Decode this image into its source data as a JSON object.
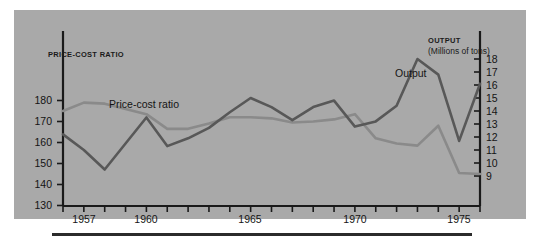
{
  "figure": {
    "panel_background": "#a9a9a9",
    "ink_color": "#1a1a1a"
  },
  "axes": {
    "left_title": "PRICE-COST RATIO",
    "right_title_line1": "OUTPUT",
    "right_title_line2": "(Millions of tons)",
    "left_ticks": [
      "180",
      "170",
      "160",
      "150",
      "140",
      "130"
    ],
    "right_ticks": [
      "18",
      "17",
      "16",
      "15",
      "14",
      "13",
      "12",
      "11",
      "10",
      "9"
    ],
    "x_ticks": [
      "1957",
      "1960",
      "1965",
      "1970",
      "1975"
    ]
  },
  "series_labels": {
    "price_cost": "Price-cost ratio",
    "output": "Output"
  },
  "chart_data": {
    "type": "line",
    "title": "",
    "subtitle": "",
    "xlabel": "",
    "ylabel": "PRICE-COST RATIO",
    "y2label": "OUTPUT (Millions of tons)",
    "grid": false,
    "legend_position": "inline-annotations",
    "x": [
      1956,
      1957,
      1958,
      1959,
      1960,
      1961,
      1962,
      1963,
      1964,
      1965,
      1966,
      1967,
      1968,
      1969,
      1970,
      1971,
      1972,
      1973,
      1974,
      1975,
      1976
    ],
    "xlim": [
      1956,
      1976
    ],
    "ylim": [
      130,
      185
    ],
    "y2lim": [
      8.6,
      18.3
    ],
    "y_tick_values": [
      180,
      170,
      160,
      150,
      140,
      130
    ],
    "y2_tick_values": [
      18,
      17,
      16,
      15,
      14,
      13,
      12,
      11,
      10,
      9
    ],
    "x_tick_values": [
      1957,
      1960,
      1965,
      1970,
      1975
    ],
    "series": [
      {
        "name": "Price-cost ratio",
        "axis": "left",
        "color": "#8a8a8a",
        "units": "index",
        "values": [
          175.0,
          179.0,
          178.5,
          176.0,
          173.5,
          166.5,
          166.5,
          169.0,
          172.0,
          172.0,
          171.5,
          169.5,
          170.0,
          171.0,
          173.5,
          162.0,
          159.5,
          158.5,
          168.0,
          145.5,
          145.0
        ]
      },
      {
        "name": "Output",
        "axis": "right",
        "color": "#585858",
        "units": "millions of tons",
        "values": [
          12.2,
          11.0,
          9.5,
          11.5,
          13.5,
          11.3,
          11.9,
          12.7,
          13.9,
          15.0,
          14.3,
          13.3,
          14.3,
          14.8,
          12.8,
          13.2,
          14.4,
          18.0,
          16.8,
          11.7,
          16.1
        ]
      }
    ]
  }
}
